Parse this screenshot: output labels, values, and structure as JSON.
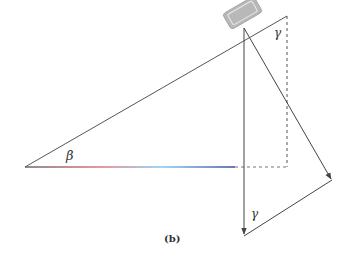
{
  "figure": {
    "caption": "(b)",
    "labels": {
      "incline_angle": "β",
      "top_angle": "γ",
      "bottom_angle": "γ"
    },
    "colors": {
      "line": "#444444",
      "block_fill": "#b8b8b8",
      "block_edge": "#9a9a9a",
      "dashed": "#555555",
      "base_gradient": [
        "#666666",
        "#e0707a",
        "#80c8ee",
        "#3a4aa0"
      ]
    }
  }
}
